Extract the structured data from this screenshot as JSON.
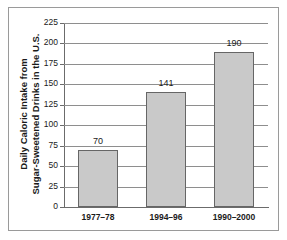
{
  "chart_data": {
    "type": "bar",
    "title": "",
    "subtitle": "",
    "xlabel": "",
    "ylabel": "Daily Caloric Intake from Sugar-Sweetened Drinks in the U.S.",
    "ylabel_lines": [
      "Daily Caloric Intake from",
      "Sugar-Sweetened Drinks in the U.S."
    ],
    "categories": [
      "1977–78",
      "1994–96",
      "1990–2000"
    ],
    "values": [
      70,
      141,
      190
    ],
    "data_labels": [
      "70",
      "141",
      "190"
    ],
    "ylim": [
      0,
      225
    ],
    "ytick_values": [
      0,
      25,
      50,
      75,
      100,
      125,
      150,
      175,
      200,
      225
    ],
    "ytick_labels": [
      "0",
      "25",
      "50",
      "75",
      "100",
      "125",
      "150",
      "175",
      "200",
      "225"
    ],
    "grid": "horizontal",
    "legend": "none",
    "bar_fill_color": "#c9c9c9",
    "bar_border_color": "#666666",
    "gridline_color": "#8e8e8e",
    "axis_color": "#6b6b6b",
    "text_color": "#1a1a1a",
    "frame_border_color": "#9a9a9a",
    "background_color": "#ffffff"
  }
}
